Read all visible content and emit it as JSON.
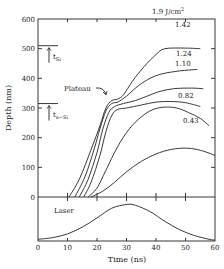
{
  "chart_data": {
    "type": "line",
    "title": "",
    "xlabel": "Time (ns)",
    "ylabel": "Depth (nm)",
    "xlim": [
      0,
      60
    ],
    "ylim": [
      0,
      600
    ],
    "x_ticks": [
      "0",
      "10",
      "20",
      "30",
      "40",
      "50",
      "60"
    ],
    "y_ticks": [
      "0",
      "100",
      "200",
      "300",
      "400",
      "500",
      "600"
    ],
    "grid": false,
    "series": [
      {
        "name": "1.9 J/cm²",
        "label": "1.9 J/cm",
        "superscript": "2",
        "points": [
          [
            10.5,
            0
          ],
          [
            14,
            60
          ],
          [
            18,
            160
          ],
          [
            21,
            240
          ],
          [
            23,
            300
          ],
          [
            25,
            325
          ],
          [
            27,
            330
          ],
          [
            29,
            345
          ],
          [
            32,
            390
          ],
          [
            36,
            440
          ],
          [
            40,
            480
          ],
          [
            43,
            500
          ],
          [
            50,
            502
          ],
          [
            55,
            500
          ]
        ]
      },
      {
        "name": "1.42",
        "label": "1.42",
        "points": [
          [
            12.5,
            0
          ],
          [
            16,
            70
          ],
          [
            19,
            160
          ],
          [
            21,
            230
          ],
          [
            23,
            290
          ],
          [
            25,
            315
          ],
          [
            27,
            320
          ],
          [
            30,
            340
          ],
          [
            34,
            375
          ],
          [
            38,
            400
          ],
          [
            42,
            415
          ],
          [
            48,
            425
          ],
          [
            54,
            430
          ]
        ]
      },
      {
        "name": "1.24",
        "label": "1.24",
        "points": [
          [
            14,
            0
          ],
          [
            17,
            60
          ],
          [
            20,
            150
          ],
          [
            22,
            230
          ],
          [
            24,
            285
          ],
          [
            26,
            305
          ],
          [
            29,
            315
          ],
          [
            33,
            325
          ],
          [
            37,
            340
          ],
          [
            41,
            355
          ],
          [
            46,
            365
          ],
          [
            52,
            367
          ],
          [
            56,
            365
          ]
        ]
      },
      {
        "name": "1.10",
        "label": "1.10",
        "points": [
          [
            15.5,
            0
          ],
          [
            18,
            50
          ],
          [
            21,
            140
          ],
          [
            23,
            220
          ],
          [
            25,
            275
          ],
          [
            27,
            295
          ],
          [
            30,
            300
          ],
          [
            35,
            310
          ],
          [
            40,
            320
          ],
          [
            45,
            322
          ],
          [
            50,
            318
          ],
          [
            55,
            305
          ]
        ]
      },
      {
        "name": "0.82",
        "label": "0.82",
        "points": [
          [
            17,
            0
          ],
          [
            20,
            30
          ],
          [
            23,
            90
          ],
          [
            27,
            170
          ],
          [
            31,
            230
          ],
          [
            35,
            270
          ],
          [
            39,
            295
          ],
          [
            43,
            303
          ],
          [
            47,
            300
          ],
          [
            51,
            285
          ],
          [
            55,
            265
          ],
          [
            58,
            240
          ]
        ]
      },
      {
        "name": "0.43",
        "label": "0.43",
        "points": [
          [
            18,
            0
          ],
          [
            22,
            20
          ],
          [
            26,
            50
          ],
          [
            30,
            85
          ],
          [
            35,
            120
          ],
          [
            40,
            145
          ],
          [
            45,
            160
          ],
          [
            50,
            165
          ],
          [
            54,
            160
          ],
          [
            58,
            148
          ],
          [
            60,
            140
          ]
        ]
      }
    ],
    "laser": {
      "label": "Laser",
      "points": [
        [
          0,
          0.04
        ],
        [
          5,
          0.08
        ],
        [
          10,
          0.17
        ],
        [
          15,
          0.33
        ],
        [
          20,
          0.55
        ],
        [
          25,
          0.78
        ],
        [
          30,
          0.87
        ],
        [
          33,
          0.85
        ],
        [
          38,
          0.7
        ],
        [
          43,
          0.47
        ],
        [
          48,
          0.27
        ],
        [
          53,
          0.13
        ],
        [
          58,
          0.04
        ],
        [
          60,
          0.02
        ]
      ]
    },
    "annotations": [
      {
        "text": "Plateau",
        "target": [
          26,
          330
        ]
      },
      {
        "text": "t",
        "subscript": "Si",
        "y": 510
      },
      {
        "text": "t",
        "subscript": "a−Si",
        "y": 315
      }
    ]
  }
}
